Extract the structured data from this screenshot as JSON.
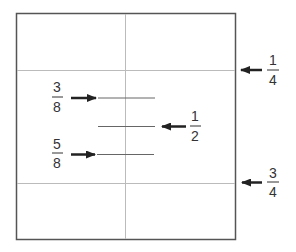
{
  "diagram": {
    "colors": {
      "border": "#555555",
      "grid": "#bbbbbb",
      "segment": "#666666",
      "arrow": "#222222",
      "text": "#333333"
    },
    "box": {
      "x": 16,
      "y": 13,
      "width": 220,
      "height": 227
    },
    "grid_lines": [
      {
        "orientation": "vertical",
        "position": "1/2",
        "coord": 125
      },
      {
        "orientation": "horizontal",
        "position": "1/4",
        "coord": 70
      },
      {
        "orientation": "horizontal",
        "position": "3/4",
        "coord": 183
      }
    ],
    "segments": [
      {
        "id": "three-eighths",
        "y": 98,
        "x1": 98,
        "x2": 155
      },
      {
        "id": "one-half",
        "y": 126,
        "x1": 98,
        "x2": 155
      },
      {
        "id": "five-eighths",
        "y": 154,
        "x1": 97,
        "x2": 154
      }
    ],
    "labels": [
      {
        "id": "quarter",
        "numerator": "1",
        "denominator": "4",
        "arrow_direction": "left",
        "target_y": 70,
        "side": "right-outside"
      },
      {
        "id": "three-eighths",
        "numerator": "3",
        "denominator": "8",
        "arrow_direction": "right",
        "target_y": 98,
        "side": "left-inside"
      },
      {
        "id": "one-half",
        "numerator": "1",
        "denominator": "2",
        "arrow_direction": "left",
        "target_y": 126,
        "side": "right-inside"
      },
      {
        "id": "five-eighths",
        "numerator": "5",
        "denominator": "8",
        "arrow_direction": "right",
        "target_y": 154,
        "side": "left-inside"
      },
      {
        "id": "three-quarters",
        "numerator": "3",
        "denominator": "4",
        "arrow_direction": "left",
        "target_y": 183,
        "side": "right-outside"
      }
    ]
  }
}
